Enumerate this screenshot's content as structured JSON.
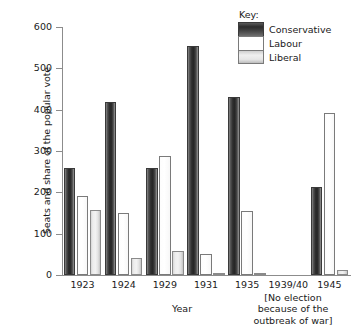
{
  "chart_data": {
    "type": "bar",
    "title": "",
    "xlabel": "Year",
    "ylabel": "Seats and share of the popular vote",
    "categories": [
      "1923",
      "1924",
      "1929",
      "1931",
      "1935",
      "1939/40",
      "1945"
    ],
    "series": [
      {
        "name": "Conservative",
        "values": [
          258,
          419,
          260,
          554,
          430,
          null,
          213
        ]
      },
      {
        "name": "Labour",
        "values": [
          191,
          151,
          287,
          52,
          154,
          null,
          393
        ]
      },
      {
        "name": "Liberal",
        "values": [
          158,
          40,
          59,
          4,
          1,
          null,
          12
        ]
      }
    ],
    "ylim": [
      0,
      600
    ],
    "yticks": [
      0,
      100,
      200,
      300,
      400,
      500,
      600
    ],
    "grid": false,
    "legend_position": "top-right",
    "legend_title": "Key:",
    "annotations": [
      {
        "category": "1939/40",
        "text": "[No election because of the outbreak of war]",
        "lines": [
          "[No election",
          "because of the",
          "outbreak of war]"
        ]
      }
    ]
  },
  "legend": {
    "title": "Key:",
    "entries": [
      {
        "label": "Conservative",
        "swatch": "conservative"
      },
      {
        "label": "Labour",
        "swatch": "labour"
      },
      {
        "label": "Liberal",
        "swatch": "liberal"
      }
    ]
  },
  "axes": {
    "y_title": "Seats and share of the popular vote",
    "x_title": "Year",
    "y_tick_labels": [
      "600",
      "500",
      "400",
      "300",
      "200",
      "100",
      "0"
    ],
    "x_tick_labels": [
      "1923",
      "1924",
      "1929",
      "1931",
      "1935",
      "1939/40",
      "1945"
    ]
  },
  "footnote": {
    "line1": "[No election",
    "line2": "because of the",
    "line3": "outbreak of war]"
  },
  "colors": {
    "conservative": "#2e2e2e",
    "labour": "#ffffff",
    "liberal": "#e2e2e2",
    "axis": "#8c8c8c",
    "text": "#1a1a1a",
    "background": "#ffffff"
  }
}
